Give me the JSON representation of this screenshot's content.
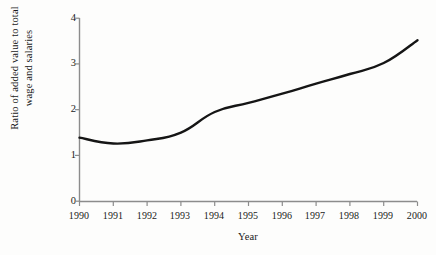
{
  "chart_data": {
    "type": "line",
    "title": "",
    "xlabel": "Year",
    "ylabel": "Ratio of added value to total wage and salaries",
    "ylabel_lines": [
      "Ratio of added value to total",
      "wage and salaries"
    ],
    "categories": [
      "1990",
      "1991",
      "1992",
      "1993",
      "1994",
      "1995",
      "1996",
      "1997",
      "1998",
      "1999",
      "2000"
    ],
    "x": [
      1990,
      1991,
      1992,
      1993,
      1994,
      1995,
      1996,
      1997,
      1998,
      1999,
      2000
    ],
    "values": [
      1.39,
      1.26,
      1.33,
      1.5,
      1.95,
      2.15,
      2.35,
      2.57,
      2.78,
      3.02,
      3.52
    ],
    "series": [
      {
        "name": "Ratio of added value to total wage and salaries",
        "values": [
          1.39,
          1.26,
          1.33,
          1.5,
          1.95,
          2.15,
          2.35,
          2.57,
          2.78,
          3.02,
          3.52
        ]
      }
    ],
    "ylim": [
      0,
      4
    ],
    "yticks": [
      "0",
      "1",
      "2",
      "3",
      "4"
    ],
    "ytick_values": [
      0,
      1,
      2,
      3,
      4
    ],
    "xlim": [
      1990,
      2000
    ],
    "grid": false,
    "legend": false,
    "legend_position": "none",
    "line_color": "#151515",
    "line_width": 2.4,
    "axis_color": "#8c8c8c",
    "background_color": "#fdfdfc"
  }
}
